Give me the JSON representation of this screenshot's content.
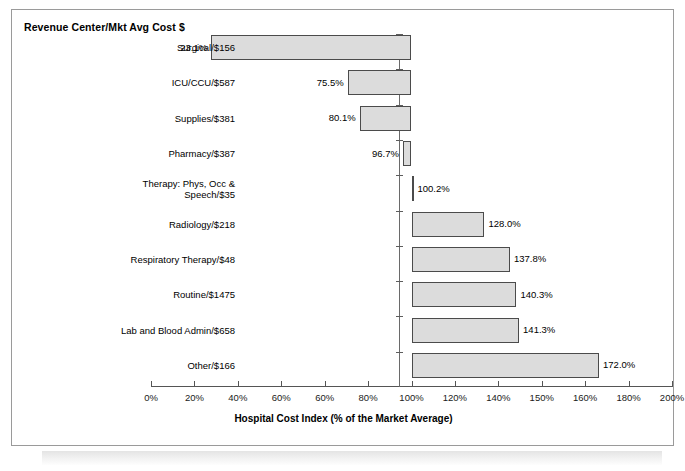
{
  "chart": {
    "title": "Revenue Center/Mkt Avg Cost $",
    "x_axis_title": "Hospital Cost Index (% of the Market Average)"
  },
  "chart_data": {
    "type": "bar",
    "orientation": "horizontal",
    "title": "Revenue Center/Mkt Avg Cost $",
    "xlabel": "Hospital Cost Index (% of the Market Average)",
    "ylabel": "",
    "xlim": [
      0,
      200
    ],
    "baseline": 100,
    "grid": false,
    "legend": null,
    "bar_fill_color": "#dcdcdc",
    "bar_border_color": "#4b4b4b",
    "xticks": [
      0,
      20,
      40,
      60,
      60,
      80,
      100,
      120,
      140,
      150,
      160,
      180,
      200
    ],
    "xticklabels": [
      "0%",
      "20%",
      "40%",
      "60%",
      "60%",
      "80%",
      "100%",
      "120%",
      "140%",
      "150%",
      "160%",
      "180%",
      "200%"
    ],
    "categories": [
      "Surgical/$156",
      "ICU/CCU/$587",
      "Supplies/$381",
      "Pharmacy/$387",
      "Therapy: Phys, Occ & Speech/$35",
      "Radiology/$218",
      "Respiratory Therapy/$48",
      "Routine/$1475",
      "Lab and Blood Admin/$658",
      "Other/$166"
    ],
    "values": [
      23.1,
      75.5,
      80.1,
      96.7,
      100.2,
      128.0,
      137.8,
      140.3,
      141.3,
      172.0
    ],
    "value_labels": [
      "23.1%",
      "75.5%",
      "80.1%",
      "96.7%",
      "100.2%",
      "128.0%",
      "137.8%",
      "140.3%",
      "141.3%",
      "172.0%"
    ]
  },
  "rows": [
    {
      "label": "Surgical/$156",
      "label_line2": "",
      "value_label": "23.1%"
    },
    {
      "label": "ICU/CCU/$587",
      "label_line2": "",
      "value_label": "75.5%"
    },
    {
      "label": "Supplies/$381",
      "label_line2": "",
      "value_label": "80.1%"
    },
    {
      "label": "Pharmacy/$387",
      "label_line2": "",
      "value_label": "96.7%"
    },
    {
      "label": "Therapy: Phys, Occ &",
      "label_line2": "Speech/$35",
      "value_label": "100.2%"
    },
    {
      "label": "Radiology/$218",
      "label_line2": "",
      "value_label": "128.0%"
    },
    {
      "label": "Respiratory Therapy/$48",
      "label_line2": "",
      "value_label": "137.8%"
    },
    {
      "label": "Routine/$1475",
      "label_line2": "",
      "value_label": "140.3%"
    },
    {
      "label": "Lab and Blood Admin/$658",
      "label_line2": "",
      "value_label": "141.3%"
    },
    {
      "label": "Other/$166",
      "label_line2": "",
      "value_label": "172.0%"
    }
  ]
}
